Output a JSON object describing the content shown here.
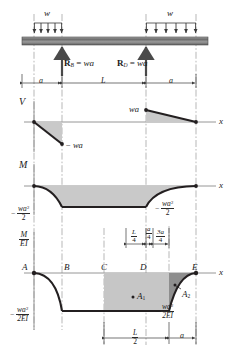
{
  "figure": {
    "type": "beam-shear-moment-deflection-diagram"
  },
  "beam": {
    "load_left_label": "w",
    "load_right_label": "w",
    "reaction_left": {
      "symbol": "R",
      "subscript": "B",
      "equals": "=",
      "value": "wa"
    },
    "reaction_right": {
      "symbol": "R",
      "subscript": "D",
      "equals": "=",
      "value": "wa"
    },
    "dim_left": "a",
    "dim_span": "L",
    "dim_right": "a"
  },
  "shear_diagram": {
    "axis_y_label": "V",
    "axis_x_label": "x",
    "left_peak_label_minus": "−",
    "left_peak_label": "wa",
    "right_peak_label": "wa"
  },
  "moment_diagram": {
    "axis_y_label": "M",
    "axis_x_label": "x",
    "left_min_sign": "−",
    "left_min_num": "wa",
    "left_min_exp": "2",
    "left_min_den": "2",
    "right_min_sign": "−",
    "right_min_num": "wa",
    "right_min_exp": "2",
    "right_min_den": "2"
  },
  "dimension_row": {
    "d1_num": "L",
    "d1_den": "4",
    "d2_num": "a",
    "d2_den": "4",
    "d3_num": "3a",
    "d3_den": "4"
  },
  "mei_diagram": {
    "axis_y_num": "M",
    "axis_y_den": "EI",
    "axis_x_label": "x",
    "points": [
      "A",
      "B",
      "C",
      "D",
      "E"
    ],
    "area_labels": [
      {
        "name": "A",
        "sub": "1"
      },
      {
        "name": "A",
        "sub": "2"
      }
    ],
    "left_min_sign": "−",
    "left_min_num": "wa",
    "left_min_exp": "2",
    "left_min_den": "2EI",
    "right_min_sign": "−",
    "right_min_num": "wa",
    "right_min_exp": "2",
    "right_min_den": "2EI",
    "dim_half_span_num": "L",
    "dim_half_span_den": "2",
    "dim_overhang": "a"
  },
  "colors": {
    "line": "#231f20",
    "fill_light": "#c9c9c9",
    "fill_dark": "#8e8e8e",
    "beam_top": "#b8b8b8",
    "beam_mid": "#6e6e6e",
    "axis": "#8a8a8a",
    "dash": "#9a9a9a"
  }
}
